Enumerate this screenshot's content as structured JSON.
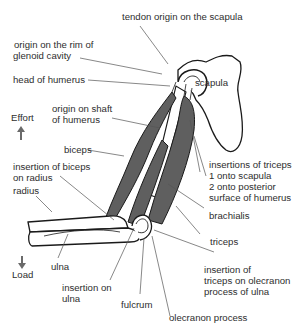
{
  "diagram": {
    "colors": {
      "muscle": "#5f5f5f",
      "outline": "#1a1a1a",
      "text": "#2e2e2e",
      "arrow": "#6a6a6a"
    },
    "labels": {
      "tendon_origin": "tendon origin on the scapula",
      "origin_rim_1": "origin on the rim of",
      "origin_rim_2": "glenoid cavity",
      "head_humerus": "head of humerus",
      "scapula": "scapula",
      "origin_shaft_1": "origin on shaft",
      "origin_shaft_2": "of humerus",
      "effort": "Effort",
      "biceps": "biceps",
      "insertion_biceps_1": "insertion of biceps",
      "insertion_biceps_2": "on radius",
      "radius": "radius",
      "insertions_triceps_1": "insertions of triceps",
      "insertions_triceps_2": "1 onto scapula",
      "insertions_triceps_3": "2 onto posterior",
      "insertions_triceps_4": "surface of humerus",
      "brachialis": "brachialis",
      "triceps": "triceps",
      "ulna": "ulna",
      "load": "Load",
      "insertion_ulna_1": "insertion on",
      "insertion_ulna_2": "ulna",
      "insertion_triceps_olecranon_1": "insertion of",
      "insertion_triceps_olecranon_2": "triceps on olecranon",
      "insertion_triceps_olecranon_3": "process of ulna",
      "fulcrum": "fulcrum",
      "olecranon_process": "olecranon process"
    },
    "indicators": {
      "effort_arrow": "arrow-up-icon",
      "load_arrow": "arrow-down-icon"
    }
  }
}
